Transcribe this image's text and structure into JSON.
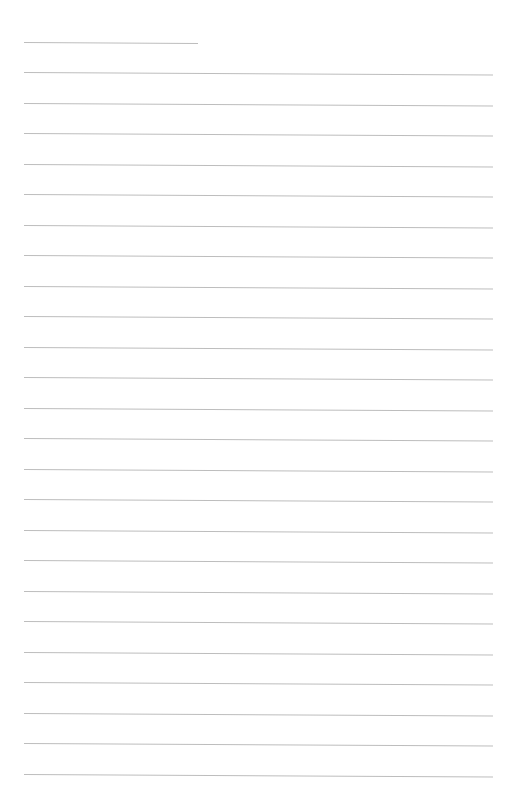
{
  "page": {
    "type": "lined-paper",
    "background_color": "#ffffff",
    "line_color": "#bdbdbd",
    "text_content": ""
  },
  "lines": {
    "left_x": 24,
    "right_x": 493,
    "first_short_line": {
      "y": 42,
      "x_start": 24,
      "x_end": 198
    },
    "first_full_line_y": 72,
    "spacing": 30.52,
    "full_line_count": 24,
    "slant_px": 2.5
  }
}
